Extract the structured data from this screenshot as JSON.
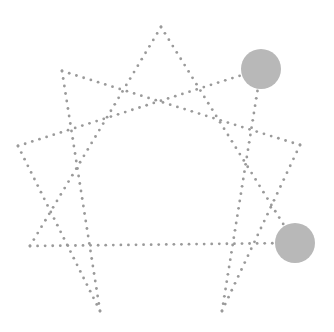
{
  "diagram": {
    "title": "Enneagram",
    "line_color": "#9a9a9a",
    "highlight_color": "#b8b8b8",
    "dot_radius": 1.4,
    "dot_spacing": 7.5,
    "points": [
      {
        "id": "9",
        "x": 161,
        "y": 27,
        "highlighted": false
      },
      {
        "id": "1",
        "x": 261,
        "y": 69,
        "highlighted": true
      },
      {
        "id": "2",
        "x": 300,
        "y": 145,
        "highlighted": false
      },
      {
        "id": "3",
        "x": 295,
        "y": 243,
        "highlighted": true
      },
      {
        "id": "4",
        "x": 222,
        "y": 311,
        "highlighted": false
      },
      {
        "id": "5",
        "x": 100,
        "y": 311,
        "highlighted": false
      },
      {
        "id": "6",
        "x": 30,
        "y": 246,
        "highlighted": false
      },
      {
        "id": "7",
        "x": 18,
        "y": 146,
        "highlighted": false
      },
      {
        "id": "8",
        "x": 62,
        "y": 71,
        "highlighted": false
      }
    ],
    "highlight_radius": 20,
    "triangle": [
      "9",
      "3",
      "6"
    ],
    "hexad": [
      "1",
      "4",
      "2",
      "8",
      "5",
      "7"
    ]
  }
}
